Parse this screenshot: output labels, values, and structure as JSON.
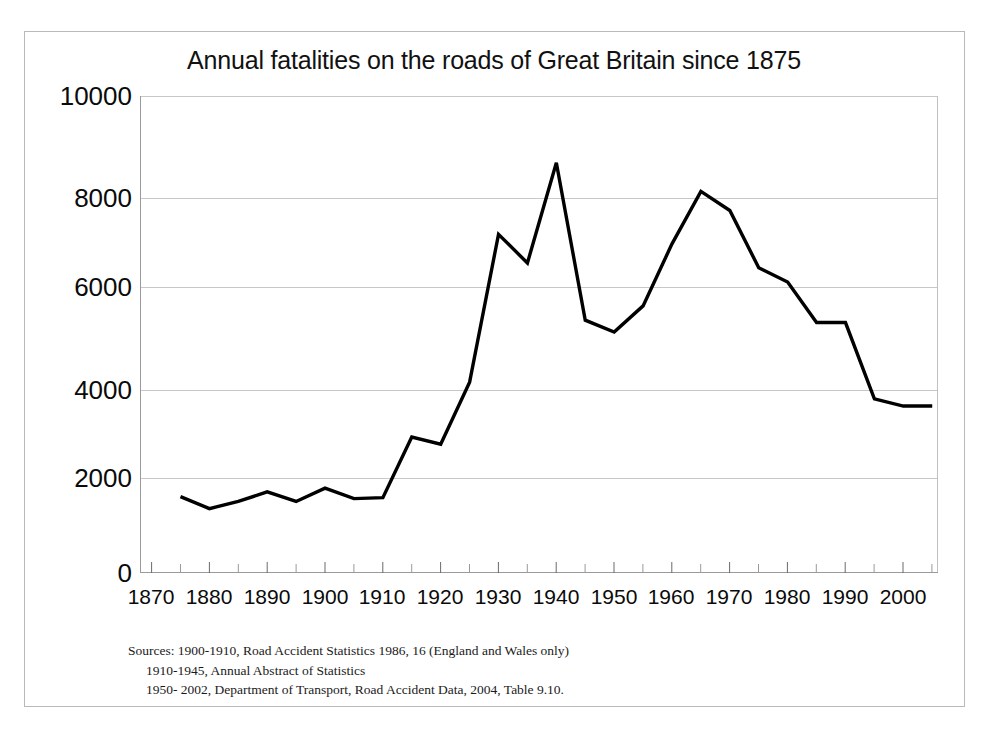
{
  "chart_data": {
    "type": "line",
    "title": "Annual fatalities on the roads of Great Britain since 1875",
    "xlabel": "",
    "ylabel": "",
    "xlim": [
      1868,
      2006
    ],
    "ylim": [
      0,
      10000
    ],
    "grid": true,
    "legend": "none",
    "x_major_ticks": [
      1870,
      1880,
      1890,
      1900,
      1910,
      1920,
      1930,
      1940,
      1950,
      1960,
      1970,
      1980,
      1990,
      2000
    ],
    "x_minor_tick_interval": 5,
    "y_ticks": [
      0,
      2000,
      4000,
      6000,
      8000,
      10000
    ],
    "x": [
      1875,
      1880,
      1885,
      1890,
      1895,
      1900,
      1905,
      1910,
      1915,
      1920,
      1925,
      1930,
      1935,
      1940,
      1945,
      1950,
      1955,
      1960,
      1965,
      1970,
      1975,
      1980,
      1985,
      1990,
      1995,
      2000,
      2005
    ],
    "values": [
      1600,
      1350,
      1500,
      1700,
      1500,
      1780,
      1560,
      1580,
      2850,
      2700,
      4000,
      7100,
      6500,
      8600,
      5300,
      5050,
      5600,
      6900,
      8000,
      7600,
      6400,
      6100,
      5250,
      5250,
      3650,
      3500,
      3500
    ],
    "series": [
      {
        "name": "Annual road fatalities",
        "color": "#000000",
        "values": [
          1600,
          1350,
          1500,
          1700,
          1500,
          1780,
          1560,
          1580,
          2850,
          2700,
          4000,
          7100,
          6500,
          8600,
          5300,
          5050,
          5600,
          6900,
          8000,
          7600,
          6400,
          6100,
          5250,
          5250,
          3650,
          3500,
          3500
        ]
      }
    ],
    "annotations": []
  },
  "axis": {
    "y_tick_labels": [
      "10000",
      "8000",
      "6000",
      "4000",
      "2000",
      "0"
    ],
    "x_tick_labels": [
      "1870",
      "1880",
      "1890",
      "1900",
      "1910",
      "1920",
      "1930",
      "1940",
      "1950",
      "1960",
      "1970",
      "1980",
      "1990",
      "2000"
    ]
  },
  "sources": {
    "line1": "Sources: 1900-1910, Road Accident Statistics 1986, 16 (England and Wales only)",
    "line2": "1910-1945, Annual Abstract of Statistics",
    "line3": "1950- 2002, Department of Transport, Road Accident Data, 2004, Table 9.10."
  },
  "colors": {
    "line": "#000000",
    "grid": "#c8c8c8",
    "axis": "#9a9a9a",
    "frame": "#b9b9b9",
    "text": "#0a0a0a",
    "background": "#ffffff"
  }
}
